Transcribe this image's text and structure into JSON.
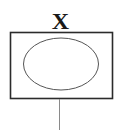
{
  "diagram": {
    "label": "X",
    "shapes": [
      {
        "type": "rectangle",
        "role": "outer-box"
      },
      {
        "type": "ellipse",
        "role": "inner-ellipse"
      },
      {
        "type": "line",
        "role": "stem"
      }
    ],
    "colors": {
      "stroke": "#2b2b2b",
      "ellipse_stroke": "#555555",
      "stem_stroke": "#8a8a8a",
      "background": "#ffffff"
    }
  }
}
